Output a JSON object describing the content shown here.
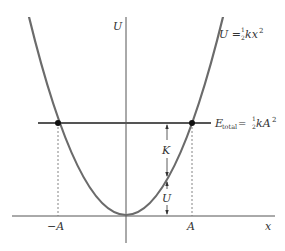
{
  "figure": {
    "curve_label": {
      "lhs": "U",
      "eq": " = ",
      "frac_num": "1",
      "frac_den": "2",
      "rhs": "kx",
      "exp": "2"
    },
    "energy_label": {
      "lhs": "E",
      "sub": "total",
      "eq": " = ",
      "frac_num": "1",
      "frac_den": "2",
      "rhs": "kA",
      "exp": "2"
    },
    "y_axis_label": "U",
    "x_axis_label": "x",
    "tick_neg": "−A",
    "tick_pos": "A",
    "kinetic_label": "K",
    "potential_label": "U",
    "colors": {
      "curve": "#6b6b6b",
      "axes": "#555555",
      "energy_line": "#555555",
      "points": "#111111",
      "text": "#333333"
    }
  }
}
